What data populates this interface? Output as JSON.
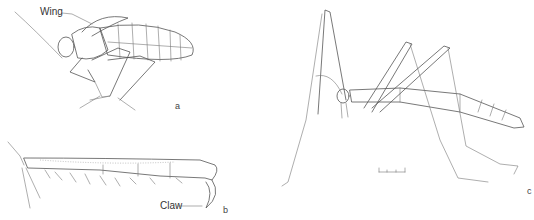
{
  "figure": {
    "panels": [
      {
        "id": "a",
        "label": "a",
        "callouts": [
          {
            "text": "Wing"
          }
        ]
      },
      {
        "id": "b",
        "label": "b",
        "callouts": [
          {
            "text": "Claw"
          }
        ]
      },
      {
        "id": "c",
        "label": "c",
        "callouts": []
      }
    ],
    "scale_bar": {
      "ticks": 4
    }
  }
}
